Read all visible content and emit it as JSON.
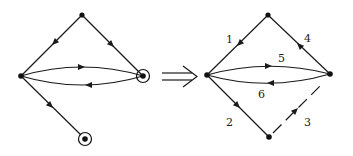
{
  "figure": {
    "colors": {
      "ink": "#1a1a1a",
      "background": "#ffffff"
    },
    "implies_symbol": "⟹",
    "left_graph": {
      "nodes": [
        {
          "id": "top",
          "type": "plain"
        },
        {
          "id": "left",
          "type": "plain"
        },
        {
          "id": "right",
          "type": "circled"
        },
        {
          "id": "bottom",
          "type": "circled"
        }
      ],
      "edges": [
        {
          "from": "top",
          "to": "left",
          "style": "solid"
        },
        {
          "from": "top",
          "to": "right",
          "style": "solid"
        },
        {
          "from": "left",
          "to": "right",
          "style": "solid",
          "curve": "upper"
        },
        {
          "from": "right",
          "to": "left",
          "style": "solid",
          "curve": "lower"
        },
        {
          "from": "left",
          "to": "bottom",
          "style": "solid"
        }
      ]
    },
    "right_graph": {
      "nodes": [
        {
          "id": "top",
          "type": "plain"
        },
        {
          "id": "left",
          "type": "plain"
        },
        {
          "id": "right",
          "type": "plain"
        },
        {
          "id": "bottom",
          "type": "plain"
        }
      ],
      "edges": [
        {
          "label": "1",
          "from": "top",
          "to": "left",
          "style": "solid"
        },
        {
          "label": "2",
          "from": "left",
          "to": "bottom",
          "style": "solid"
        },
        {
          "label": "3",
          "from": "bottom",
          "to": "right",
          "style": "dashed"
        },
        {
          "label": "4",
          "from": "right",
          "to": "top",
          "style": "solid"
        },
        {
          "label": "5",
          "from": "left",
          "to": "right",
          "style": "solid",
          "curve": "upper"
        },
        {
          "label": "6",
          "from": "right",
          "to": "left",
          "style": "solid",
          "curve": "lower"
        }
      ]
    }
  }
}
